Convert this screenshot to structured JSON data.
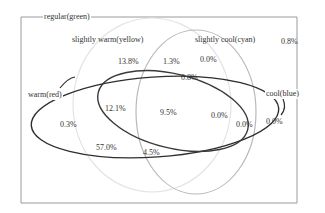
{
  "diagram": {
    "type": "venn",
    "frame_label": "regular(green)",
    "sets": [
      {
        "id": "warm",
        "label": "warm(red)",
        "stroke": "#2b2b2b"
      },
      {
        "id": "slightly_warm",
        "label": "slightly warm(yellow)",
        "stroke": "#e6e6e6"
      },
      {
        "id": "slightly_cool",
        "label": "slightly cool(cyan)",
        "stroke": "#bdbdbd"
      },
      {
        "id": "cool",
        "label": "cool(blue)",
        "stroke": "#3a3a3a"
      }
    ],
    "regions": {
      "outside_all": "0.8%",
      "slightly_warm_only": "13.8%",
      "slightly_warm_and_slightly_cool": "1.3%",
      "slightly_cool_only": "0.0%",
      "warm_cool_sw_sc_top": "0.8%",
      "warm_only": "0.3%",
      "warm_and_slightly_warm": "57.0%",
      "warm_sw_sc_bottom": "4.5%",
      "warm_cool_slightly_warm": "12.1%",
      "warm_cool_sw_sc_center": "9.5%",
      "warm_cool_slightly_cool": "0.0%",
      "cool_slightly_cool": "0.0%",
      "cool_only": "0.0%"
    }
  }
}
